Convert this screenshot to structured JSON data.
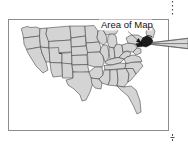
{
  "figure": {
    "label": "Area of Map",
    "frame": {
      "x": 8,
      "y": 19,
      "width": 161,
      "height": 112
    },
    "colors": {
      "state_fill": "#d4d4d4",
      "state_stroke": "#3a3a3a",
      "highlight_fill": "#1b1b1b",
      "frame_stroke": "#8c8c8c",
      "callout_fill": "#d9d9d9",
      "dotted_line": "#4a4a4a",
      "background": "#ffffff",
      "text": "#111111"
    },
    "map": {
      "region": "United States",
      "highlighted_region": "Northeast",
      "highlight_description": "dark filled area in the northeastern United States"
    },
    "annotations": {
      "pointer": "arrow-from-label-to-highlight",
      "callout": "wedge-extending-right-off-frame",
      "right_dotted_line": "vertical-dotted-guide",
      "bottom_tick": "crop-tick-mark"
    }
  }
}
